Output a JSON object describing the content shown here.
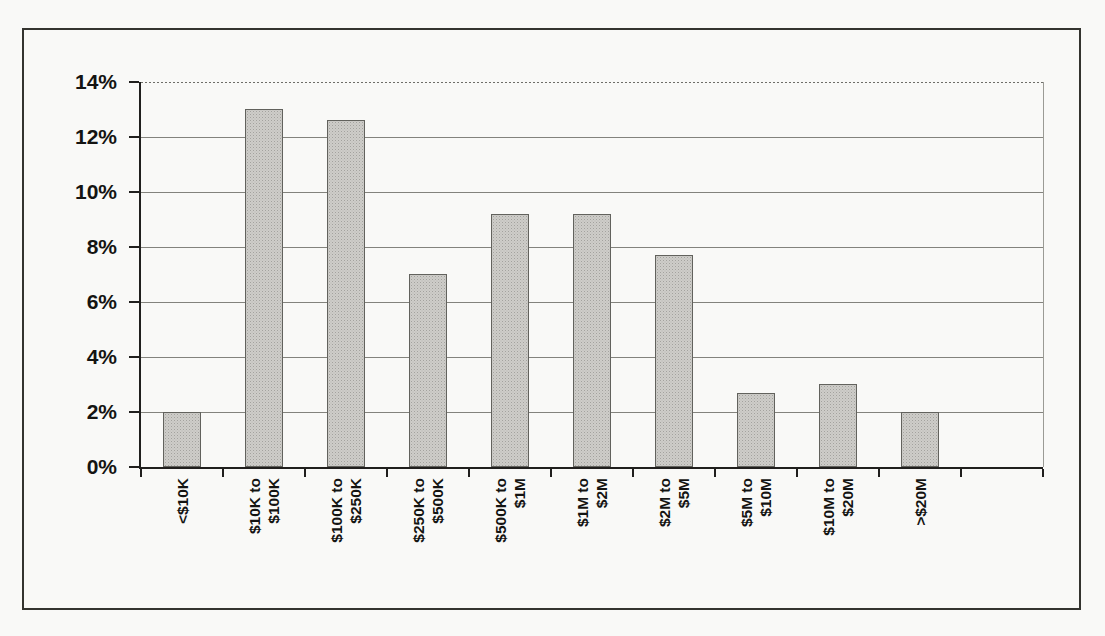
{
  "page": {
    "background_color": "#f9f9f7",
    "frame_border_color": "#34342f"
  },
  "chart_data": {
    "type": "bar",
    "title": "",
    "xlabel": "",
    "ylabel": "",
    "categories": [
      [
        "<$10K"
      ],
      [
        "$10K to",
        "$100K"
      ],
      [
        "$100K to",
        "$250K"
      ],
      [
        "$250K to",
        "$500K"
      ],
      [
        "$500K to",
        "$1M"
      ],
      [
        "$1M to",
        "$2M"
      ],
      [
        "$2M to",
        "$5M"
      ],
      [
        "$5M to",
        "$10M"
      ],
      [
        "$10M to",
        "$20M"
      ],
      [
        ">$20M"
      ]
    ],
    "values": [
      2.0,
      13.0,
      12.6,
      7.0,
      9.2,
      9.2,
      7.7,
      2.7,
      3.0,
      2.0
    ],
    "ylim": [
      0,
      14
    ],
    "ytick_step": 2,
    "ytick_labels": [
      "0%",
      "2%",
      "4%",
      "6%",
      "8%",
      "10%",
      "12%",
      "14%"
    ],
    "grid": true,
    "legend": false,
    "x_right_padding_slots": 1,
    "bar_fill_color": "#cecdc9",
    "bar_border_color": "#62625d",
    "gridline_color": "#83837d",
    "axis_color": "#201f1d"
  }
}
